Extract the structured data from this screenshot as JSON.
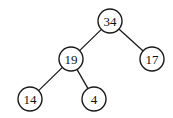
{
  "diagram": {
    "type": "binary-tree",
    "node_radius": 12,
    "stroke_color": "#1a1a1a",
    "fill_color": "#ffffff",
    "nodes": [
      {
        "id": "n34",
        "label": "34",
        "x": 110,
        "y": 21
      },
      {
        "id": "n19",
        "label": "19",
        "x": 71,
        "y": 59
      },
      {
        "id": "n17",
        "label": "17",
        "x": 152,
        "y": 59
      },
      {
        "id": "n14",
        "label": "14",
        "x": 30,
        "y": 99
      },
      {
        "id": "n4",
        "label": "4",
        "x": 94,
        "y": 99
      }
    ],
    "edges": [
      {
        "from": "n34",
        "to": "n19"
      },
      {
        "from": "n34",
        "to": "n17"
      },
      {
        "from": "n19",
        "to": "n14"
      },
      {
        "from": "n19",
        "to": "n4"
      }
    ]
  }
}
